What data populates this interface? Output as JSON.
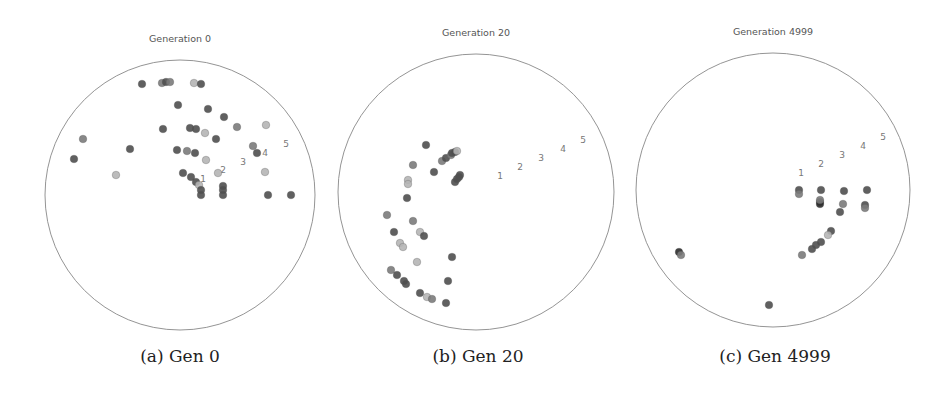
{
  "figure": {
    "captions": [
      "(a) Gen 0",
      "(b) Gen 20",
      "(c) Gen 4999"
    ]
  },
  "chart_data": [
    {
      "type": "scatter",
      "title": "Generation 0",
      "caption": "(a) Gen 0",
      "frame": "circle",
      "center": [
        180,
        195
      ],
      "radius": 135,
      "annotations": [
        {
          "text": "1",
          "x": 203,
          "y": 182
        },
        {
          "text": "2",
          "x": 223,
          "y": 173
        },
        {
          "text": "3",
          "x": 243,
          "y": 165
        },
        {
          "text": "4",
          "x": 265,
          "y": 156
        },
        {
          "text": "5",
          "x": 286,
          "y": 147
        }
      ],
      "points": [
        {
          "x": 142,
          "y": 84,
          "shade": "dark"
        },
        {
          "x": 162,
          "y": 83,
          "shade": "mid"
        },
        {
          "x": 166,
          "y": 82,
          "shade": "dark"
        },
        {
          "x": 170,
          "y": 82,
          "shade": "mid"
        },
        {
          "x": 194,
          "y": 83,
          "shade": "light"
        },
        {
          "x": 201,
          "y": 84,
          "shade": "dark"
        },
        {
          "x": 178,
          "y": 105,
          "shade": "dark"
        },
        {
          "x": 208,
          "y": 109,
          "shade": "dark"
        },
        {
          "x": 224,
          "y": 117,
          "shade": "dark"
        },
        {
          "x": 163,
          "y": 129,
          "shade": "dark"
        },
        {
          "x": 190,
          "y": 128,
          "shade": "dark"
        },
        {
          "x": 196,
          "y": 129,
          "shade": "dark"
        },
        {
          "x": 205,
          "y": 133,
          "shade": "light"
        },
        {
          "x": 237,
          "y": 127,
          "shade": "mid"
        },
        {
          "x": 266,
          "y": 125,
          "shade": "light"
        },
        {
          "x": 216,
          "y": 139,
          "shade": "dark"
        },
        {
          "x": 83,
          "y": 139,
          "shade": "mid"
        },
        {
          "x": 74,
          "y": 159,
          "shade": "dark"
        },
        {
          "x": 130,
          "y": 149,
          "shade": "dark"
        },
        {
          "x": 177,
          "y": 150,
          "shade": "dark"
        },
        {
          "x": 187,
          "y": 151,
          "shade": "mid"
        },
        {
          "x": 195,
          "y": 153,
          "shade": "dark"
        },
        {
          "x": 253,
          "y": 146,
          "shade": "mid"
        },
        {
          "x": 257,
          "y": 153,
          "shade": "dark"
        },
        {
          "x": 206,
          "y": 160,
          "shade": "light"
        },
        {
          "x": 116,
          "y": 175,
          "shade": "light"
        },
        {
          "x": 183,
          "y": 173,
          "shade": "dark"
        },
        {
          "x": 191,
          "y": 177,
          "shade": "dark"
        },
        {
          "x": 196,
          "y": 182,
          "shade": "dark"
        },
        {
          "x": 199,
          "y": 185,
          "shade": "light"
        },
        {
          "x": 218,
          "y": 173,
          "shade": "light"
        },
        {
          "x": 265,
          "y": 172,
          "shade": "light"
        },
        {
          "x": 201,
          "y": 190,
          "shade": "dark"
        },
        {
          "x": 201,
          "y": 195,
          "shade": "dark"
        },
        {
          "x": 223,
          "y": 186,
          "shade": "dark"
        },
        {
          "x": 223,
          "y": 190,
          "shade": "dark"
        },
        {
          "x": 223,
          "y": 195,
          "shade": "dark"
        },
        {
          "x": 268,
          "y": 195,
          "shade": "dark"
        },
        {
          "x": 291,
          "y": 195,
          "shade": "dark"
        }
      ]
    },
    {
      "type": "scatter",
      "title": "Generation 20",
      "caption": "(b) Gen 20",
      "frame": "circle",
      "center": [
        476,
        192
      ],
      "radius": 138,
      "annotations": [
        {
          "text": "1",
          "x": 500,
          "y": 179
        },
        {
          "text": "2",
          "x": 520,
          "y": 170
        },
        {
          "text": "3",
          "x": 541,
          "y": 161
        },
        {
          "text": "4",
          "x": 563,
          "y": 152
        },
        {
          "text": "5",
          "x": 583,
          "y": 143
        }
      ],
      "points": [
        {
          "x": 426,
          "y": 145,
          "shade": "dark"
        },
        {
          "x": 442,
          "y": 161,
          "shade": "mid"
        },
        {
          "x": 446,
          "y": 158,
          "shade": "dark"
        },
        {
          "x": 451,
          "y": 155,
          "shade": "mid"
        },
        {
          "x": 452,
          "y": 153,
          "shade": "dark"
        },
        {
          "x": 455,
          "y": 152,
          "shade": "dark"
        },
        {
          "x": 457,
          "y": 151,
          "shade": "light"
        },
        {
          "x": 413,
          "y": 165,
          "shade": "mid"
        },
        {
          "x": 434,
          "y": 172,
          "shade": "dark"
        },
        {
          "x": 455,
          "y": 182,
          "shade": "dark"
        },
        {
          "x": 457,
          "y": 179,
          "shade": "dark"
        },
        {
          "x": 459,
          "y": 177,
          "shade": "dark"
        },
        {
          "x": 460,
          "y": 175,
          "shade": "dark"
        },
        {
          "x": 408,
          "y": 180,
          "shade": "light"
        },
        {
          "x": 408,
          "y": 184,
          "shade": "light"
        },
        {
          "x": 407,
          "y": 198,
          "shade": "dark"
        },
        {
          "x": 387,
          "y": 215,
          "shade": "mid"
        },
        {
          "x": 413,
          "y": 221,
          "shade": "mid"
        },
        {
          "x": 394,
          "y": 232,
          "shade": "dark"
        },
        {
          "x": 420,
          "y": 232,
          "shade": "light"
        },
        {
          "x": 424,
          "y": 236,
          "shade": "dark"
        },
        {
          "x": 400,
          "y": 243,
          "shade": "light"
        },
        {
          "x": 403,
          "y": 247,
          "shade": "light"
        },
        {
          "x": 452,
          "y": 257,
          "shade": "dark"
        },
        {
          "x": 417,
          "y": 262,
          "shade": "light"
        },
        {
          "x": 391,
          "y": 270,
          "shade": "mid"
        },
        {
          "x": 397,
          "y": 275,
          "shade": "dark"
        },
        {
          "x": 404,
          "y": 281,
          "shade": "dark"
        },
        {
          "x": 406,
          "y": 284,
          "shade": "dark"
        },
        {
          "x": 448,
          "y": 281,
          "shade": "dark"
        },
        {
          "x": 420,
          "y": 293,
          "shade": "dark"
        },
        {
          "x": 427,
          "y": 297,
          "shade": "light"
        },
        {
          "x": 432,
          "y": 299,
          "shade": "mid"
        },
        {
          "x": 446,
          "y": 303,
          "shade": "dark"
        }
      ]
    },
    {
      "type": "scatter",
      "title": "Generation 4999",
      "caption": "(c) Gen 4999",
      "frame": "circle",
      "center": [
        773,
        190
      ],
      "radius": 137,
      "annotations": [
        {
          "text": "1",
          "x": 801,
          "y": 176
        },
        {
          "text": "2",
          "x": 821,
          "y": 167
        },
        {
          "text": "3",
          "x": 842,
          "y": 158
        },
        {
          "text": "4",
          "x": 863,
          "y": 149
        },
        {
          "text": "5",
          "x": 883,
          "y": 140
        }
      ],
      "points": [
        {
          "x": 799,
          "y": 190,
          "shade": "dark"
        },
        {
          "x": 799,
          "y": 194,
          "shade": "mid"
        },
        {
          "x": 821,
          "y": 190,
          "shade": "dark"
        },
        {
          "x": 844,
          "y": 191,
          "shade": "dark"
        },
        {
          "x": 867,
          "y": 190,
          "shade": "dark"
        },
        {
          "x": 820,
          "y": 202,
          "shade": "dark"
        },
        {
          "x": 820,
          "y": 204,
          "shade": "black"
        },
        {
          "x": 820,
          "y": 200,
          "shade": "mid"
        },
        {
          "x": 843,
          "y": 204,
          "shade": "mid"
        },
        {
          "x": 865,
          "y": 205,
          "shade": "dark"
        },
        {
          "x": 865,
          "y": 208,
          "shade": "mid"
        },
        {
          "x": 840,
          "y": 212,
          "shade": "dark"
        },
        {
          "x": 831,
          "y": 231,
          "shade": "dark"
        },
        {
          "x": 828,
          "y": 235,
          "shade": "light"
        },
        {
          "x": 821,
          "y": 242,
          "shade": "dark"
        },
        {
          "x": 816,
          "y": 245,
          "shade": "dark"
        },
        {
          "x": 812,
          "y": 249,
          "shade": "dark"
        },
        {
          "x": 802,
          "y": 255,
          "shade": "mid"
        },
        {
          "x": 679,
          "y": 252,
          "shade": "black"
        },
        {
          "x": 681,
          "y": 255,
          "shade": "mid"
        },
        {
          "x": 769,
          "y": 305,
          "shade": "dark"
        }
      ]
    }
  ],
  "colors": {
    "dark": "#4f4f4f",
    "mid": "#7b7b7b",
    "light": "#b5b5b5",
    "black": "#2a2a2a",
    "circle": "#888888",
    "title": "#555555",
    "label": "#777777"
  }
}
